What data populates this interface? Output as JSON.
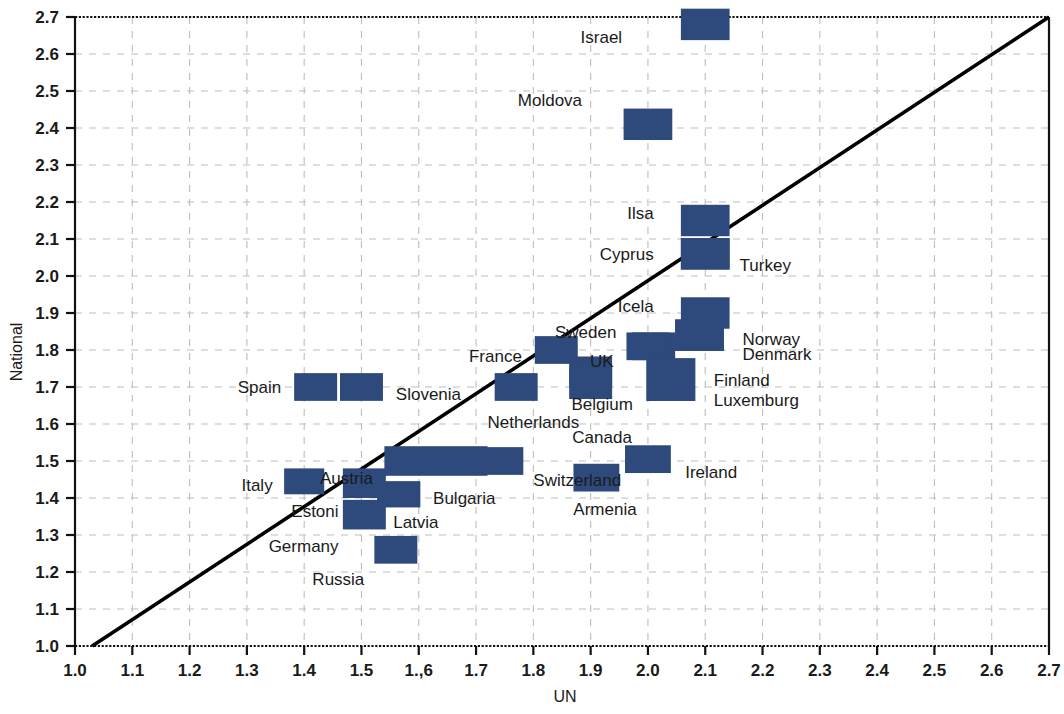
{
  "chart_data": {
    "type": "scatter",
    "title": "",
    "xlabel": "UN",
    "ylabel": "National",
    "xlim": [
      1.0,
      2.7
    ],
    "ylim": [
      1.0,
      2.7
    ],
    "grid": true,
    "legend": "none",
    "marker_color": "#2e4a7d",
    "reference_line": {
      "name": "identity-line",
      "description": "y = x diagonal reference line",
      "from": [
        1.03,
        1.0
      ],
      "to": [
        2.7,
        2.7
      ],
      "color": "#000000"
    },
    "x_ticks": [
      "1.0",
      "1.1",
      "1.2",
      "1.3",
      "1.4",
      "1.5",
      "1.,6",
      "1.7",
      "1.8",
      "1.9",
      "2.0",
      "2.1",
      "2.2",
      "2.3",
      "2.4",
      "2.5",
      "2.6",
      "2.7"
    ],
    "x_tick_values": [
      1.0,
      1.1,
      1.2,
      1.3,
      1.4,
      1.5,
      1.6,
      1.7,
      1.8,
      1.9,
      2.0,
      2.1,
      2.2,
      2.3,
      2.4,
      2.5,
      2.6,
      2.7
    ],
    "y_ticks": [
      "1.0",
      "1.1",
      "1.2",
      "1.3",
      "1.4",
      "1.5",
      "1.6",
      "1.7",
      "1.8",
      "1.9",
      "2.0",
      "2.1",
      "2.2",
      "2.3",
      "2.4",
      "2.5",
      "2.6",
      "2.7"
    ],
    "y_tick_values": [
      1.0,
      1.1,
      1.2,
      1.3,
      1.4,
      1.5,
      1.6,
      1.7,
      1.8,
      1.9,
      2.0,
      2.1,
      2.2,
      2.3,
      2.4,
      2.5,
      2.6,
      2.7
    ],
    "points": [
      {
        "label": "Israel",
        "x": 2.1,
        "y": 2.68,
        "w": 0.085,
        "h": 0.085,
        "label_dx": -0.145,
        "label_dy": -0.035,
        "anchor": "end"
      },
      {
        "label": "Moldova",
        "x": 2.0,
        "y": 2.41,
        "w": 0.085,
        "h": 0.085,
        "label_dx": -0.115,
        "label_dy": 0.065,
        "anchor": "end"
      },
      {
        "label": "Ilsa",
        "x": 2.1,
        "y": 2.15,
        "w": 0.085,
        "h": 0.085,
        "label_dx": -0.09,
        "label_dy": 0.02,
        "anchor": "end"
      },
      {
        "label": "Cyprus",
        "x": 2.1,
        "y": 2.06,
        "w": 0.085,
        "h": 0.085,
        "label_dx": -0.09,
        "label_dy": 0.0,
        "anchor": "end"
      },
      {
        "label": "Turkey",
        "x": 2.1,
        "y": 2.06,
        "w": 0.085,
        "h": 0.085,
        "label_dx": 0.06,
        "label_dy": -0.03,
        "anchor": "start"
      },
      {
        "label": "Icela",
        "x": 2.1,
        "y": 1.9,
        "w": 0.085,
        "h": 0.085,
        "label_dx": -0.09,
        "label_dy": 0.02,
        "anchor": "end"
      },
      {
        "label": "Norway",
        "x": 2.09,
        "y": 1.84,
        "w": 0.085,
        "h": 0.085,
        "label_dx": 0.075,
        "label_dy": -0.01,
        "anchor": "start"
      },
      {
        "label": "Denmark",
        "x": 2.09,
        "y": 1.84,
        "w": 0.085,
        "h": 0.085,
        "label_dx": 0.075,
        "label_dy": -0.05,
        "anchor": "start"
      },
      {
        "label": "Sweden",
        "x": 2.01,
        "y": 1.81,
        "w": 0.075,
        "h": 0.075,
        "label_dx": -0.065,
        "label_dy": 0.04,
        "anchor": "end"
      },
      {
        "label": "UK",
        "x": 2.0,
        "y": 1.81,
        "w": 0.075,
        "h": 0.075,
        "label_dx": -0.06,
        "label_dy": -0.04,
        "anchor": "end"
      },
      {
        "label": "Finland",
        "x": 2.04,
        "y": 1.72,
        "w": 0.085,
        "h": 0.115,
        "label_dx": 0.075,
        "label_dy": 0.0,
        "anchor": "start"
      },
      {
        "label": "Luxemburg",
        "x": 2.04,
        "y": 1.72,
        "w": 0.085,
        "h": 0.115,
        "label_dx": 0.075,
        "label_dy": -0.055,
        "anchor": "start"
      },
      {
        "label": "France",
        "x": 1.84,
        "y": 1.8,
        "w": 0.075,
        "h": 0.075,
        "label_dx": -0.06,
        "label_dy": -0.015,
        "anchor": "end"
      },
      {
        "label": "Belgium",
        "x": 1.9,
        "y": 1.74,
        "w": 0.075,
        "h": 0.085,
        "label_dx": 0.02,
        "label_dy": -0.085,
        "anchor": "middle"
      },
      {
        "label": "Canada",
        "x": 1.9,
        "y": 1.71,
        "w": 0.075,
        "h": 0.085,
        "label_dx": 0.02,
        "label_dy": -0.145,
        "anchor": "middle"
      },
      {
        "label": "Netherlands",
        "x": 1.77,
        "y": 1.7,
        "w": 0.075,
        "h": 0.075,
        "label_dx": 0.03,
        "label_dy": -0.095,
        "anchor": "middle"
      },
      {
        "label": "Spain",
        "x": 1.42,
        "y": 1.7,
        "w": 0.075,
        "h": 0.075,
        "label_dx": -0.06,
        "label_dy": 0.0,
        "anchor": "end"
      },
      {
        "label": "Slovenia",
        "x": 1.5,
        "y": 1.7,
        "w": 0.075,
        "h": 0.075,
        "label_dx": 0.06,
        "label_dy": -0.02,
        "anchor": "start"
      },
      {
        "label": "Austria",
        "x": 1.63,
        "y": 1.5,
        "w": 0.18,
        "h": 0.08,
        "label_dx": -0.11,
        "label_dy": -0.045,
        "anchor": "end"
      },
      {
        "label": "Switzerland",
        "x": 1.74,
        "y": 1.5,
        "w": 0.085,
        "h": 0.075,
        "label_dx": 0.06,
        "label_dy": -0.05,
        "anchor": "start"
      },
      {
        "label": "Ireland",
        "x": 2.0,
        "y": 1.505,
        "w": 0.08,
        "h": 0.075,
        "label_dx": 0.065,
        "label_dy": -0.035,
        "anchor": "start"
      },
      {
        "label": "Armenia",
        "x": 1.91,
        "y": 1.455,
        "w": 0.08,
        "h": 0.075,
        "label_dx": 0.015,
        "label_dy": -0.085,
        "anchor": "middle"
      },
      {
        "label": "Italy",
        "x": 1.4,
        "y": 1.445,
        "w": 0.07,
        "h": 0.07,
        "label_dx": -0.055,
        "label_dy": -0.01,
        "anchor": "end"
      },
      {
        "label": "Estoni",
        "x": 1.505,
        "y": 1.44,
        "w": 0.075,
        "h": 0.08,
        "label_dx": -0.045,
        "label_dy": -0.075,
        "anchor": "end"
      },
      {
        "label": "Bulgaria",
        "x": 1.565,
        "y": 1.41,
        "w": 0.075,
        "h": 0.07,
        "label_dx": 0.06,
        "label_dy": -0.01,
        "anchor": "start"
      },
      {
        "label": "Latvia",
        "x": 1.565,
        "y": 1.41,
        "w": 0.075,
        "h": 0.07,
        "label_dx": 0.03,
        "label_dy": -0.075,
        "anchor": "middle"
      },
      {
        "label": "Germany",
        "x": 1.505,
        "y": 1.355,
        "w": 0.075,
        "h": 0.08,
        "label_dx": -0.045,
        "label_dy": -0.085,
        "anchor": "end"
      },
      {
        "label": "Russia",
        "x": 1.56,
        "y": 1.26,
        "w": 0.075,
        "h": 0.075,
        "label_dx": -0.055,
        "label_dy": -0.08,
        "anchor": "end"
      }
    ]
  }
}
